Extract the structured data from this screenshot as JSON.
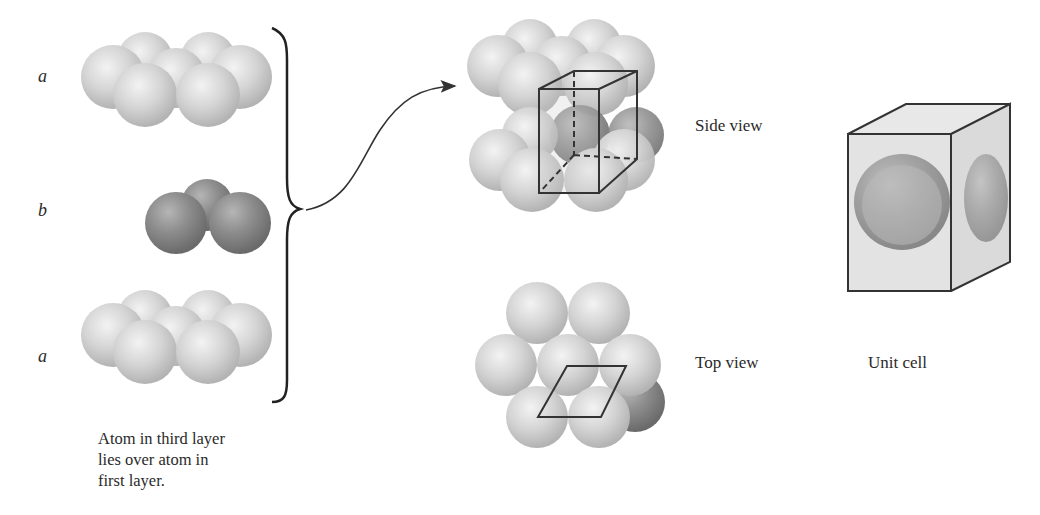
{
  "layers": {
    "top": {
      "label": "a"
    },
    "middle": {
      "label": "b"
    },
    "bottom": {
      "label": "a"
    }
  },
  "caption": {
    "lines": [
      "Atom in third layer",
      "lies over atom in",
      "first layer."
    ]
  },
  "views": {
    "side": {
      "label": "Side view"
    },
    "top": {
      "label": "Top view"
    },
    "unit_cell": {
      "label": "Unit cell"
    }
  },
  "colors": {
    "light_atom": "#d6d6d6",
    "dark_atom": "#8a8a8a",
    "line": "#333333",
    "background": "#ffffff"
  }
}
